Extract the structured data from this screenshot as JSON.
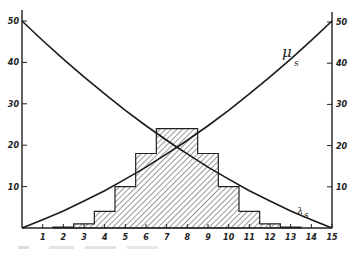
{
  "chart_data": {
    "type": "bar",
    "title": "",
    "xlabel": "",
    "ylabel": "",
    "xlim": [
      0,
      15
    ],
    "ylim": [
      0,
      50
    ],
    "grid": false,
    "legend": "none (curves labelled directly)",
    "x_ticks": [
      1,
      2,
      3,
      4,
      5,
      6,
      7,
      8,
      9,
      10,
      11,
      12,
      13,
      14,
      15
    ],
    "y_ticks_left": [
      10,
      20,
      30,
      40,
      50
    ],
    "y_ticks_right": [
      10,
      20,
      30,
      40,
      50
    ],
    "histogram": {
      "name": "distribution (hatched)",
      "categories": [
        2,
        3,
        4,
        5,
        6,
        7,
        8,
        9,
        10,
        11,
        12,
        13
      ],
      "values": [
        0.2,
        1,
        4,
        10,
        18,
        24,
        24,
        18,
        10,
        4,
        1,
        0.2
      ],
      "fill": "diagonal hatch"
    },
    "series": [
      {
        "name": "μs",
        "label": "μ",
        "subscript": "s",
        "type": "line",
        "x": [
          0,
          1,
          2,
          3,
          4,
          5,
          6,
          7,
          7.5,
          8,
          9,
          10,
          11,
          12,
          13,
          14,
          15
        ],
        "values": [
          0,
          2,
          4.1,
          6.5,
          9.0,
          11.8,
          14.7,
          17.9,
          19.5,
          21.2,
          24.7,
          28.4,
          32.4,
          36.5,
          40.8,
          45.3,
          50
        ]
      },
      {
        "name": "λs",
        "label": "λ",
        "subscript": "s",
        "type": "line",
        "x": [
          0,
          1,
          2,
          3,
          4,
          5,
          6,
          7,
          7.5,
          8,
          9,
          10,
          11,
          12,
          13,
          14,
          15
        ],
        "values": [
          50,
          45.3,
          40.8,
          36.5,
          32.4,
          28.4,
          24.7,
          21.2,
          19.5,
          17.9,
          14.7,
          11.8,
          9.0,
          6.5,
          4.1,
          2,
          0
        ]
      }
    ],
    "annotations": [
      {
        "text": "μ",
        "sub": "s",
        "near": "upper right curve"
      },
      {
        "text": "λ",
        "sub": "s",
        "near": "lower right curve"
      }
    ]
  }
}
